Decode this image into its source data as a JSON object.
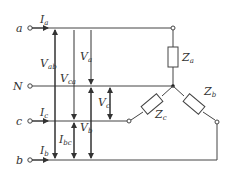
{
  "diagram": {
    "title": "",
    "type": "three-phase Y-connected load circuit",
    "terminals": [
      {
        "id": "a",
        "label": "a"
      },
      {
        "id": "N",
        "label": "N"
      },
      {
        "id": "c",
        "label": "c"
      },
      {
        "id": "b",
        "label": "b"
      }
    ],
    "currents": [
      {
        "id": "Ia",
        "main": "I",
        "sub": "a"
      },
      {
        "id": "Ic",
        "main": "I",
        "sub": "c"
      },
      {
        "id": "Ib",
        "main": "I",
        "sub": "b"
      }
    ],
    "voltages": [
      {
        "id": "Vab",
        "main": "V",
        "sub": "ab"
      },
      {
        "id": "Vca",
        "main": "V",
        "sub": "ca"
      },
      {
        "id": "Va",
        "main": "V",
        "sub": "a"
      },
      {
        "id": "Vc",
        "main": "V",
        "sub": "c"
      },
      {
        "id": "Vb",
        "main": "V",
        "sub": "b"
      },
      {
        "id": "Ibc",
        "main": "I",
        "sub": "bc"
      }
    ],
    "impedances": [
      {
        "id": "Za",
        "main": "Z",
        "sub": "a"
      },
      {
        "id": "Zb",
        "main": "Z",
        "sub": "b"
      },
      {
        "id": "Zc",
        "main": "Z",
        "sub": "c"
      }
    ]
  }
}
